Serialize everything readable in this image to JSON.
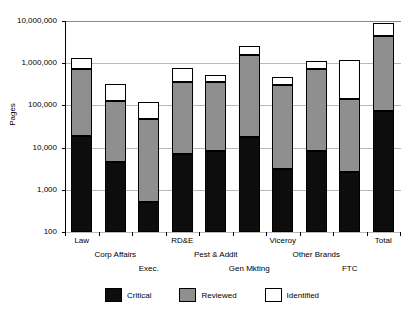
{
  "chart_data": {
    "type": "bar",
    "stacked": true,
    "scale": "log",
    "title": "",
    "xlabel": "",
    "ylabel": "Pages",
    "ylim": [
      100,
      10000000
    ],
    "grid": true,
    "legend_position": "bottom",
    "y_ticks": [
      {
        "value": 10000000,
        "label": "10,000,000"
      },
      {
        "value": 1000000,
        "label": "1,000,000"
      },
      {
        "value": 100000,
        "label": "100,000"
      },
      {
        "value": 10000,
        "label": "10,000"
      },
      {
        "value": 1000,
        "label": "1,000"
      },
      {
        "value": 100,
        "label": "100"
      }
    ],
    "categories": [
      "Law",
      "Corp Affairs",
      "Exec.",
      "RD&E",
      "Pest & Addit",
      "Gen Mkting",
      "Viceroy",
      "Other Brands",
      "FTC",
      "Total"
    ],
    "series": [
      {
        "name": "Critical",
        "color": "#0d0d0d",
        "values": [
          19000,
          4600,
          510,
          7200,
          8200,
          17500,
          3100,
          8500,
          2600,
          73000
        ]
      },
      {
        "name": "Reviewed",
        "color": "#8f8f8f",
        "values": [
          730000,
          125000,
          47000,
          360000,
          350000,
          1550000,
          300000,
          730000,
          145000,
          4300000
        ]
      },
      {
        "name": "Identified",
        "color": "#ffffff",
        "values": [
          1300000,
          320000,
          120000,
          760000,
          520000,
          2600000,
          465000,
          1120000,
          1220000,
          8800000
        ]
      }
    ]
  },
  "legend": {
    "items": [
      {
        "label": "Critical",
        "swatch": "black-swatch"
      },
      {
        "label": "Reviewed",
        "swatch": "grey-swatch"
      },
      {
        "label": "Identified",
        "swatch": "white-swatch"
      }
    ]
  },
  "axis": {
    "y_title": "Pages"
  }
}
